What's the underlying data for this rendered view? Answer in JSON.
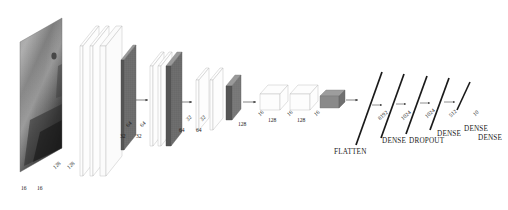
{
  "figure": {
    "title": "",
    "type": "cnn-architecture-diagram",
    "background": "#ffffff",
    "ink": "#1a1a1a"
  },
  "input": {
    "kind": "image-thumbnail",
    "description": "grayscale sample image",
    "depth_label": "16",
    "second_depth_label": "16"
  },
  "dim_labels": {
    "horizontal": [
      {
        "text": "16",
        "x": 21,
        "y": 186
      },
      {
        "text": "16",
        "x": 37,
        "y": 186
      },
      {
        "text": "32",
        "x": 120,
        "y": 134
      },
      {
        "text": "32",
        "x": 136,
        "y": 134
      },
      {
        "text": "64",
        "x": 179,
        "y": 128
      },
      {
        "text": "64",
        "x": 196,
        "y": 128
      },
      {
        "text": "128",
        "x": 238,
        "y": 122
      },
      {
        "text": "128",
        "x": 268,
        "y": 118
      },
      {
        "text": "128",
        "x": 297,
        "y": 118
      }
    ],
    "diagonal": [
      {
        "text": "128",
        "x": 56,
        "y": 165
      },
      {
        "text": "128",
        "x": 70,
        "y": 165
      },
      {
        "text": "64",
        "x": 129,
        "y": 123
      },
      {
        "text": "64",
        "x": 143,
        "y": 123
      },
      {
        "text": "32",
        "x": 189,
        "y": 117
      },
      {
        "text": "32",
        "x": 203,
        "y": 117
      },
      {
        "text": "16",
        "x": 261,
        "y": 112
      },
      {
        "text": "16",
        "x": 290,
        "y": 112
      },
      {
        "text": "16",
        "x": 317,
        "y": 112
      },
      {
        "text": "8192",
        "x": 381,
        "y": 116
      },
      {
        "text": "1024",
        "x": 404,
        "y": 116
      },
      {
        "text": "1024",
        "x": 428,
        "y": 114
      },
      {
        "text": "512",
        "x": 452,
        "y": 113
      },
      {
        "text": "10",
        "x": 476,
        "y": 112
      }
    ]
  },
  "stage_labels": [
    {
      "text": "FLATTEN",
      "x": 334,
      "y": 149
    },
    {
      "text": "DENSE",
      "x": 382,
      "y": 138
    },
    {
      "text": "DROPOUT",
      "x": 409,
      "y": 138
    },
    {
      "text": "DENSE",
      "x": 437,
      "y": 131
    },
    {
      "text": "DENSE",
      "x": 464,
      "y": 126
    },
    {
      "text": "DENSE",
      "x": 478,
      "y": 135
    }
  ],
  "chart_data": {
    "type": "diagram",
    "layers": [
      {
        "name": "input-image",
        "spatial": "128x128",
        "channels": "16",
        "style": "image"
      },
      {
        "name": "conv-block-1",
        "spatial": "128",
        "channels": "16",
        "style": "outline-slab"
      },
      {
        "name": "conv-block-2",
        "spatial": "128",
        "channels": "16",
        "style": "outline-slab"
      },
      {
        "name": "pool-1",
        "spatial": "64",
        "channels": "32",
        "style": "filled-slab"
      },
      {
        "name": "conv-block-3",
        "spatial": "64",
        "channels": "32",
        "style": "outline-slab"
      },
      {
        "name": "conv-block-4",
        "spatial": "64",
        "channels": "32",
        "style": "outline-slab"
      },
      {
        "name": "pool-2",
        "spatial": "32",
        "channels": "64",
        "style": "filled-slab"
      },
      {
        "name": "conv-block-5",
        "spatial": "32",
        "channels": "64",
        "style": "outline-slab"
      },
      {
        "name": "conv-block-6",
        "spatial": "32",
        "channels": "64",
        "style": "outline-slab"
      },
      {
        "name": "pool-3",
        "spatial": "16",
        "channels": "128",
        "style": "filled-slab"
      },
      {
        "name": "conv-block-7",
        "spatial": "16",
        "channels": "128",
        "style": "outline-slab"
      },
      {
        "name": "conv-block-8",
        "spatial": "16",
        "channels": "128",
        "style": "outline-slab"
      },
      {
        "name": "pool-4",
        "spatial": "16",
        "channels": "128",
        "style": "filled-bar"
      },
      {
        "name": "flatten",
        "units": "8192",
        "style": "line"
      },
      {
        "name": "dense-1",
        "units": "1024",
        "style": "line"
      },
      {
        "name": "dropout",
        "units": "1024",
        "style": "line"
      },
      {
        "name": "dense-2",
        "units": "512",
        "style": "line"
      },
      {
        "name": "dense-3",
        "units": "10",
        "style": "line"
      }
    ],
    "dense_units": [
      8192,
      1024,
      1024,
      512,
      10
    ]
  }
}
